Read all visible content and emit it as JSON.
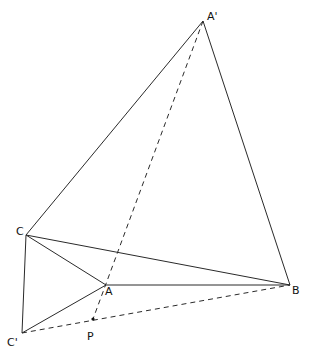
{
  "diagram": {
    "type": "geometric-construction",
    "points": {
      "A_prime": {
        "label": "A'",
        "x": 203,
        "y": 21,
        "lx": 207,
        "ly": 20
      },
      "C": {
        "label": "C",
        "x": 26,
        "y": 235,
        "lx": 16,
        "ly": 235
      },
      "A": {
        "label": "A",
        "x": 106,
        "y": 285,
        "lx": 105,
        "ly": 295
      },
      "B": {
        "label": "B",
        "x": 290,
        "y": 285,
        "lx": 292,
        "ly": 294
      },
      "C_prime": {
        "label": "C'",
        "x": 22,
        "y": 333,
        "lx": 7,
        "ly": 346
      },
      "P": {
        "label": "P",
        "x": 93,
        "y": 319,
        "lx": 87,
        "ly": 340
      }
    },
    "solid_segments": [
      [
        "A_prime",
        "C"
      ],
      [
        "A_prime",
        "B"
      ],
      [
        "C",
        "B"
      ],
      [
        "C",
        "A"
      ],
      [
        "A",
        "B"
      ],
      [
        "C",
        "C_prime"
      ],
      [
        "C_prime",
        "A"
      ]
    ],
    "dashed_segments": [
      [
        "A_prime",
        "P"
      ],
      [
        "C_prime",
        "B"
      ]
    ]
  }
}
